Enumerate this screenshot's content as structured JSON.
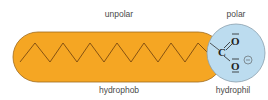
{
  "labels": {
    "top_left": "unpolar",
    "top_right": "polar",
    "bottom_left": "hydrophob",
    "bottom_right": "hydrophil"
  },
  "molecule": {
    "carbon": "C",
    "oxygen_top": "O",
    "oxygen_bottom": "O",
    "charge": "⊖"
  },
  "colors": {
    "tail": "#f5a623",
    "tail_stroke": "#a0691a",
    "head": "#bcdcef",
    "head_stroke": "#8aa0ad",
    "text": "#4a4a4a"
  }
}
